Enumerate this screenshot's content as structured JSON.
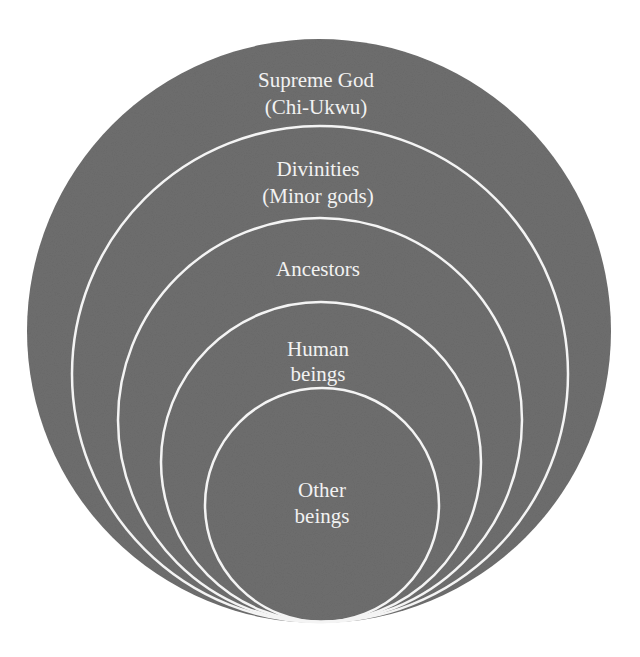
{
  "diagram": {
    "type": "nested-circles",
    "colors": {
      "fill": "#6e6e6e",
      "ring_stroke": "#f4f4f4",
      "text": "#f2f2f2",
      "background": "#ffffff"
    },
    "layers": [
      {
        "line1": "Supreme God",
        "line2": "(Chi-Ukwu)"
      },
      {
        "line1": "Divinities",
        "line2": "(Minor gods)"
      },
      {
        "line1": "Ancestors",
        "line2": ""
      },
      {
        "line1": "Human",
        "line2": "beings"
      },
      {
        "line1": "Other",
        "line2": "beings"
      }
    ]
  }
}
